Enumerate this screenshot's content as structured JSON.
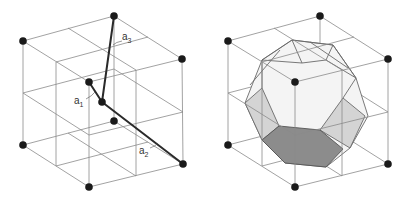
{
  "figure": {
    "left_panel": {
      "description": "BCC cubic cell with primitive vectors",
      "vectors": [
        {
          "label": "a",
          "subscript": "1"
        },
        {
          "label": "a",
          "subscript": "2"
        },
        {
          "label": "a",
          "subscript": "3"
        }
      ]
    },
    "right_panel": {
      "description": "BCC cubic cell with Wigner-Seitz cell (truncated octahedron)"
    },
    "colors": {
      "grid": "#8a8a8a",
      "vector": "#2a2a2a",
      "atom": "#1a1a1a",
      "light_face": "#d4d4d4",
      "dark_face": "#8c8c8c",
      "polyhedron_body": "#f4f4f4"
    }
  }
}
